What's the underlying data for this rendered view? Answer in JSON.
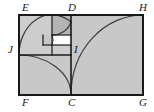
{
  "figure": {
    "type": "geometry-diagram",
    "background_color": "#ffffff",
    "fill_color": "#c8c8c8",
    "fill_color_light": "#d2d2d2",
    "white_fill": "#ffffff",
    "stroke_color": "#1a1a1a",
    "arc_color": "#3d3d3d",
    "outer_rect": {
      "x": 19,
      "y": 15,
      "width": 124,
      "height": 80
    },
    "divider_vertical_x": 71,
    "divider_horizontal_y": 55,
    "inner_square_x": 52,
    "inner_square_y": 35,
    "tiny_square_x": 52,
    "tiny_square_y": 35
  },
  "labels": {
    "E": {
      "text": "E",
      "x": 22,
      "y": 2
    },
    "D": {
      "text": "D",
      "x": 68,
      "y": 2
    },
    "H": {
      "text": "H",
      "x": 139,
      "y": 2
    },
    "J": {
      "text": "J",
      "x": 8,
      "y": 44
    },
    "I": {
      "text": "I",
      "x": 74,
      "y": 44
    },
    "F": {
      "text": "F",
      "x": 22,
      "y": 98
    },
    "C": {
      "text": "C",
      "x": 68,
      "y": 98
    },
    "G": {
      "text": "G",
      "x": 139,
      "y": 98
    }
  }
}
